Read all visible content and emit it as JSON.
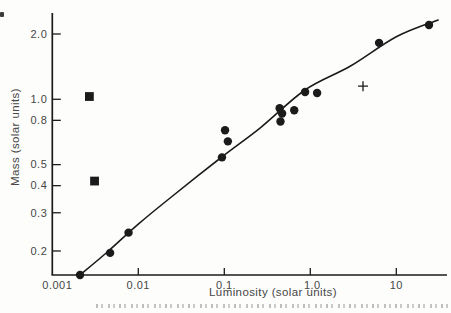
{
  "figure": {
    "background": "#fdfdfb",
    "ink": "#1b1b1b",
    "text_color": "#474747"
  },
  "chart_data": {
    "type": "scatter",
    "title": "",
    "xlabel": "Luminosity (solar units)",
    "ylabel": "Mass (solar units)",
    "x_scale": "log",
    "y_scale": "log",
    "xlim": [
      0.001,
      39
    ],
    "ylim": [
      0.155,
      2.5
    ],
    "grid": false,
    "legend": "none",
    "x_ticks": [
      {
        "label": "0.001",
        "value": 0.001,
        "tick": false,
        "label_dx": 5
      },
      {
        "label": "0.01",
        "value": 0.01,
        "tick": true,
        "label_dx": 0
      },
      {
        "label": "0.1",
        "value": 0.1,
        "tick": true,
        "label_dx": 0
      },
      {
        "label": "1.0",
        "value": 1.0,
        "tick": true,
        "label_dx": 2
      },
      {
        "label": "10",
        "value": 10,
        "tick": true,
        "label_dx": 0
      }
    ],
    "y_ticks": [
      {
        "label": "2.0",
        "value": 2.0
      },
      {
        "label": "1.0",
        "value": 1.0
      },
      {
        "label": "0.8",
        "value": 0.8
      },
      {
        "label": "0.5",
        "value": 0.5
      },
      {
        "label": "0.4",
        "value": 0.4
      },
      {
        "label": "0.3",
        "value": 0.3
      },
      {
        "label": "0.2",
        "value": 0.2
      }
    ],
    "series": [
      {
        "name": "filled-circle points",
        "marker": "circle",
        "points": [
          [
            0.0021,
            0.155
          ],
          [
            0.0047,
            0.196
          ],
          [
            0.0077,
            0.243
          ],
          [
            0.094,
            0.54
          ],
          [
            0.102,
            0.72
          ],
          [
            0.11,
            0.64
          ],
          [
            0.44,
            0.91
          ],
          [
            0.47,
            0.86
          ],
          [
            0.45,
            0.79
          ],
          [
            0.65,
            0.89
          ],
          [
            0.87,
            1.08
          ],
          [
            1.2,
            1.07
          ],
          [
            6.3,
            1.82
          ],
          [
            24,
            2.2
          ]
        ]
      },
      {
        "name": "filled-square outlier points",
        "marker": "square",
        "points": [
          [
            0.0027,
            1.03
          ],
          [
            0.0031,
            0.42
          ]
        ]
      },
      {
        "name": "plus-cross point",
        "marker": "plus",
        "points": [
          [
            4.1,
            1.15
          ]
        ]
      }
    ],
    "curve": {
      "name": "mass-luminosity relation curve",
      "points": [
        [
          0.0021,
          0.155
        ],
        [
          0.0045,
          0.2
        ],
        [
          0.01,
          0.266
        ],
        [
          0.0234,
          0.351
        ],
        [
          0.0935,
          0.542
        ],
        [
          0.26,
          0.737
        ],
        [
          0.867,
          1.104
        ],
        [
          2.9,
          1.42
        ],
        [
          10,
          1.94
        ],
        [
          30.6,
          2.32
        ]
      ]
    }
  }
}
